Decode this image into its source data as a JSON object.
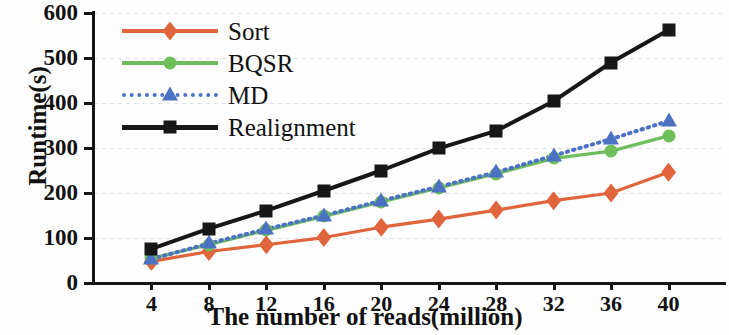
{
  "chart_data": {
    "type": "line",
    "title": "",
    "xlabel": "The number of reads(million)",
    "ylabel": "Runtime(s)",
    "x": [
      4,
      8,
      12,
      16,
      20,
      24,
      28,
      32,
      36,
      40
    ],
    "xticks": [
      "4",
      "8",
      "12",
      "16",
      "20",
      "24",
      "28",
      "32",
      "36",
      "40"
    ],
    "yticks": [
      "0",
      "100",
      "200",
      "300",
      "400",
      "500",
      "600"
    ],
    "xlim": [
      0,
      44
    ],
    "ylim": [
      0,
      600
    ],
    "grid": true,
    "legend_position": "upper-left",
    "series": [
      {
        "name": "Sort",
        "color": "#E0653C",
        "marker": "diamond",
        "linestyle": "solid",
        "values": [
          48,
          70,
          85,
          101,
          124,
          142,
          162,
          183,
          200,
          246
        ]
      },
      {
        "name": "BQSR",
        "color": "#6FBE5C",
        "marker": "circle",
        "linestyle": "solid",
        "values": [
          55,
          85,
          117,
          148,
          180,
          211,
          243,
          277,
          293,
          327
        ]
      },
      {
        "name": "MD",
        "color": "#4C72C4",
        "marker": "triangle",
        "linestyle": "dotted",
        "values": [
          53,
          88,
          120,
          150,
          183,
          214,
          246,
          283,
          320,
          360
        ]
      },
      {
        "name": "Realignment",
        "color": "#171717",
        "marker": "square",
        "linestyle": "solid",
        "values": [
          76,
          121,
          161,
          205,
          250,
          299,
          338,
          404,
          490,
          562
        ]
      }
    ]
  },
  "axis": {
    "y_title": "Runtime(s)",
    "x_title": "The number of reads(million)"
  }
}
